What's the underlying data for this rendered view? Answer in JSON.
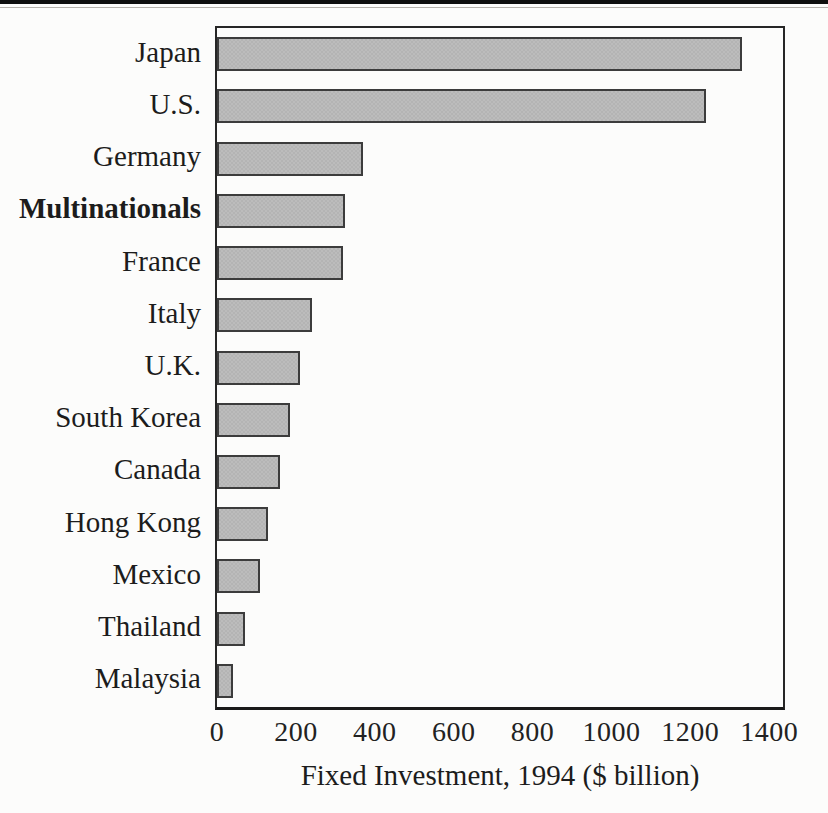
{
  "figure": {
    "top_rule": "decorative-black-rule",
    "background": "#fcfcfb"
  },
  "chart_data": {
    "type": "bar",
    "orientation": "horizontal",
    "title": "",
    "xlabel": "Fixed Investment, 1994 ($ billion)",
    "ylabel": "",
    "categories": [
      "Japan",
      "U.S.",
      "Germany",
      "Multinationals",
      "France",
      "Italy",
      "U.K.",
      "South Korea",
      "Canada",
      "Hong Kong",
      "Mexico",
      "Thailand",
      "Malaysia"
    ],
    "values": [
      1330,
      1240,
      370,
      325,
      320,
      240,
      210,
      185,
      160,
      130,
      110,
      70,
      40
    ],
    "bold_categories": [
      "Multinationals"
    ],
    "xlim": [
      0,
      1400
    ],
    "x_axis_full_scale": 1435,
    "xticks": [
      0,
      200,
      400,
      600,
      800,
      1000,
      1200,
      1400
    ],
    "grid": false,
    "legend": null,
    "bar_fill_color": "#b8b8b8",
    "bar_border_color": "#3c3c3c",
    "plot_border_color": "#262626"
  }
}
